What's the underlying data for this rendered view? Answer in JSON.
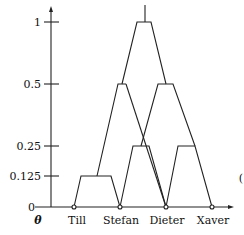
{
  "diagram": {
    "y_axis_label": "θ",
    "y_ticks": [
      {
        "label": "1",
        "value": 1
      },
      {
        "label": "0.5",
        "value": 0.5
      },
      {
        "label": "0.25",
        "value": 0.25
      },
      {
        "label": "0.125",
        "value": 0.125
      },
      {
        "label": "0",
        "value": 0
      }
    ],
    "x_labels": [
      "Till",
      "Stefan",
      "Dieter",
      "Xaver"
    ],
    "edge_mark": "("
  }
}
